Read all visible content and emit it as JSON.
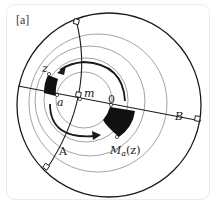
{
  "panel_label": "[a]",
  "labels": {
    "z": "z",
    "a": "a",
    "m": "m",
    "O": "0",
    "A": "A",
    "B": "B",
    "M_main": "M",
    "M_sub": "a",
    "M_arg": "(z)"
  },
  "colors": {
    "stroke": "#1a1a1a",
    "thin_circle": "#8a8a8a",
    "fill_region": "#111111",
    "card_border": "#ececec"
  }
}
